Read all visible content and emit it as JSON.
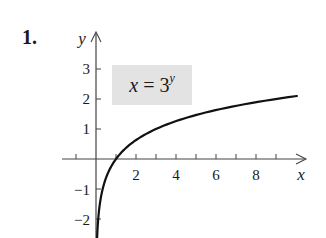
{
  "problem": {
    "number": "1."
  },
  "equation": {
    "lhs": "x",
    "op": "=",
    "base": "3",
    "exponent": "y"
  },
  "axes": {
    "x_label": "x",
    "y_label": "y",
    "x_tick_labels": [
      "2",
      "4",
      "6",
      "8"
    ],
    "y_tick_labels": [
      "3",
      "2",
      "1",
      "-1",
      "-2"
    ]
  },
  "colors": {
    "curve": "#111111",
    "axis": "#444444",
    "label_box": "#e3e3e3",
    "text": "#1a1a1a"
  },
  "chart_data": {
    "type": "line",
    "title": "",
    "annotation": "x = 3^y",
    "xlabel": "x",
    "ylabel": "y",
    "xlim": [
      -1,
      10.5
    ],
    "ylim": [
      -2.6,
      3.8
    ],
    "x_ticks": [
      -1,
      1,
      2,
      3,
      4,
      5,
      6,
      7,
      8,
      9
    ],
    "x_tick_labels": {
      "2": "2",
      "4": "4",
      "6": "6",
      "8": "8"
    },
    "y_ticks": [
      -2,
      -1,
      1,
      2,
      3
    ],
    "y_tick_labels": {
      "-2": "−2",
      "-1": "−1",
      "1": "1",
      "2": "2",
      "3": "3"
    },
    "grid": false,
    "legend": null,
    "series": [
      {
        "name": "x = 3^y",
        "x": [
          0.056,
          0.111,
          0.2,
          0.333,
          0.5,
          0.75,
          1,
          1.5,
          2,
          3,
          4,
          5,
          6,
          7,
          8,
          9,
          10
        ],
        "y": [
          -2.63,
          -2.0,
          -1.46,
          -1.0,
          -0.63,
          -0.26,
          0,
          0.37,
          0.63,
          1.0,
          1.26,
          1.46,
          1.63,
          1.77,
          1.89,
          2.0,
          2.1
        ]
      }
    ]
  }
}
